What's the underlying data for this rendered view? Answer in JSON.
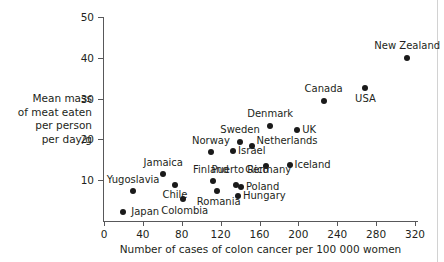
{
  "chart_data": {
    "type": "scatter",
    "title": "",
    "xlabel": "Number of cases of colon cancer per 100 000 women",
    "ylabel": "Mean mass of meat eaten per person per day/g",
    "ylabel_lines": [
      "Mean mass",
      "of meat eaten",
      "per person",
      "per day/g"
    ],
    "xlim": [
      0,
      324
    ],
    "ylim": [
      0,
      50
    ],
    "xticks": [
      0,
      40,
      80,
      120,
      160,
      200,
      240,
      280,
      320
    ],
    "yticks": [
      10,
      20,
      30,
      40,
      50
    ],
    "grid": false,
    "legend": null,
    "point_color": "#1a1a1a",
    "axis_color": "#58585a",
    "points": [
      {
        "label": "Japan",
        "x": 20,
        "y": 2.2,
        "lx": 28,
        "ly": 2.2,
        "align": "right"
      },
      {
        "label": "Yugoslavia",
        "x": 30,
        "y": 7.3,
        "lx": 30,
        "ly": 10.0,
        "align": "center"
      },
      {
        "label": "Jamaica",
        "x": 61,
        "y": 11.5,
        "lx": 61,
        "ly": 14.3,
        "align": "center"
      },
      {
        "label": "Chile",
        "x": 73,
        "y": 8.8,
        "lx": 73,
        "ly": 6.3,
        "align": "center"
      },
      {
        "label": "Colombia",
        "x": 81,
        "y": 5.4,
        "lx": 83,
        "ly": 2.5,
        "align": "center"
      },
      {
        "label": "Norway",
        "x": 110,
        "y": 16.8,
        "lx": 110,
        "ly": 19.6,
        "align": "center"
      },
      {
        "label": "Finland",
        "x": 112,
        "y": 9.8,
        "lx": 110,
        "ly": 12.5,
        "align": "center"
      },
      {
        "label": "Romania",
        "x": 116,
        "y": 7.3,
        "lx": 118,
        "ly": 4.7,
        "align": "center"
      },
      {
        "label": "Israel",
        "x": 133,
        "y": 17.1,
        "lx": 138,
        "ly": 17.1,
        "align": "right"
      },
      {
        "label": "Puerto Rico",
        "x": 136,
        "y": 8.8,
        "lx": 140,
        "ly": 12.5,
        "align": "center"
      },
      {
        "label": "Hungary",
        "x": 138,
        "y": 6.1,
        "lx": 143,
        "ly": 6.1,
        "align": "right"
      },
      {
        "label": "Sweden",
        "x": 140,
        "y": 19.3,
        "lx": 140,
        "ly": 22.2,
        "align": "center"
      },
      {
        "label": "Poland",
        "x": 141,
        "y": 8.3,
        "lx": 146,
        "ly": 8.4,
        "align": "right"
      },
      {
        "label": "Netherlands",
        "x": 152,
        "y": 18.5,
        "lx": 157,
        "ly": 19.5,
        "align": "right"
      },
      {
        "label": "Germany",
        "x": 167,
        "y": 13.4,
        "lx": 169,
        "ly": 12.4,
        "align": "center"
      },
      {
        "label": "Denmark",
        "x": 171,
        "y": 23.4,
        "lx": 171,
        "ly": 26.3,
        "align": "center"
      },
      {
        "label": "Iceland",
        "x": 191,
        "y": 13.7,
        "lx": 196,
        "ly": 13.7,
        "align": "right"
      },
      {
        "label": "UK",
        "x": 199,
        "y": 22.4,
        "lx": 204,
        "ly": 22.4,
        "align": "right"
      },
      {
        "label": "Canada",
        "x": 226,
        "y": 29.5,
        "lx": 226,
        "ly": 32.3,
        "align": "center"
      },
      {
        "label": "USA",
        "x": 269,
        "y": 32.7,
        "lx": 269,
        "ly": 30.0,
        "align": "center"
      },
      {
        "label": "New Zealand",
        "x": 312,
        "y": 40.0,
        "lx": 312,
        "ly": 42.8,
        "align": "center"
      }
    ]
  }
}
